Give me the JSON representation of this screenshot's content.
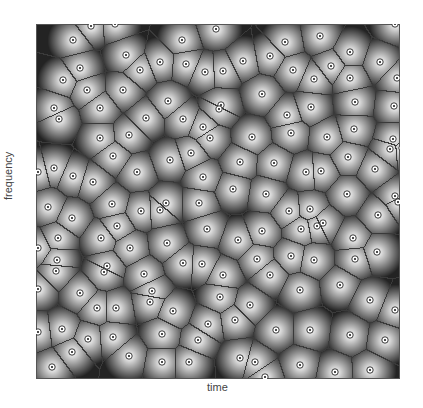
{
  "figure": {
    "xlabel": "time",
    "ylabel": "frequency",
    "plot_box": {
      "x": 36,
      "y": 24,
      "width": 364,
      "height": 355
    },
    "colors": {
      "background": "#ffffff",
      "cell_edge": "#3a3a3a",
      "shade_dark": "#111111",
      "shade_light": "#ffffff",
      "frame": "#555555"
    }
  },
  "chart_data": {
    "type": "voronoi",
    "title": "",
    "xlabel": "time",
    "ylabel": "frequency",
    "grid": false,
    "legend": null,
    "sites": [
      [
        91,
        26
      ],
      [
        115,
        24
      ],
      [
        73,
        40
      ],
      [
        126,
        55
      ],
      [
        80,
        68
      ],
      [
        140,
        70
      ],
      [
        63,
        80
      ],
      [
        87,
        90
      ],
      [
        123,
        90
      ],
      [
        100,
        108
      ],
      [
        54,
        108
      ],
      [
        59,
        119
      ],
      [
        146,
        118
      ],
      [
        100,
        138
      ],
      [
        129,
        135
      ],
      [
        182,
        40
      ],
      [
        216,
        29
      ],
      [
        160,
        62
      ],
      [
        186,
        64
      ],
      [
        205,
        72
      ],
      [
        223,
        71
      ],
      [
        243,
        61
      ],
      [
        270,
        56
      ],
      [
        262,
        94
      ],
      [
        168,
        101
      ],
      [
        221,
        105
      ],
      [
        219,
        109
      ],
      [
        183,
        119
      ],
      [
        203,
        127
      ],
      [
        210,
        138
      ],
      [
        252,
        137
      ],
      [
        395,
        24
      ],
      [
        285,
        42
      ],
      [
        320,
        36
      ],
      [
        350,
        52
      ],
      [
        380,
        62
      ],
      [
        331,
        66
      ],
      [
        293,
        70
      ],
      [
        314,
        79
      ],
      [
        350,
        78
      ],
      [
        397,
        78
      ],
      [
        355,
        102
      ],
      [
        311,
        107
      ],
      [
        394,
        106
      ],
      [
        287,
        115
      ],
      [
        354,
        129
      ],
      [
        291,
        133
      ],
      [
        327,
        137
      ],
      [
        393,
        139
      ],
      [
        402,
        148
      ],
      [
        38,
        172
      ],
      [
        54,
        168
      ],
      [
        73,
        176
      ],
      [
        93,
        182
      ],
      [
        113,
        156
      ],
      [
        137,
        172
      ],
      [
        48,
        207
      ],
      [
        72,
        218
      ],
      [
        112,
        204
      ],
      [
        141,
        211
      ],
      [
        58,
        238
      ],
      [
        101,
        238
      ],
      [
        117,
        226
      ],
      [
        130,
        248
      ],
      [
        57,
        260
      ],
      [
        107,
        266
      ],
      [
        38,
        248
      ],
      [
        170,
        160
      ],
      [
        191,
        153
      ],
      [
        240,
        162
      ],
      [
        203,
        177
      ],
      [
        233,
        189
      ],
      [
        266,
        194
      ],
      [
        166,
        203
      ],
      [
        160,
        210
      ],
      [
        199,
        203
      ],
      [
        207,
        229
      ],
      [
        262,
        231
      ],
      [
        238,
        240
      ],
      [
        301,
        229
      ],
      [
        167,
        243
      ],
      [
        183,
        263
      ],
      [
        202,
        264
      ],
      [
        257,
        259
      ],
      [
        274,
        163
      ],
      [
        306,
        172
      ],
      [
        321,
        171
      ],
      [
        348,
        157
      ],
      [
        375,
        169
      ],
      [
        390,
        149
      ],
      [
        347,
        194
      ],
      [
        395,
        196
      ],
      [
        398,
        202
      ],
      [
        289,
        211
      ],
      [
        310,
        209
      ],
      [
        378,
        215
      ],
      [
        317,
        226
      ],
      [
        323,
        223
      ],
      [
        353,
        238
      ],
      [
        291,
        256
      ],
      [
        314,
        260
      ],
      [
        355,
        259
      ],
      [
        377,
        252
      ],
      [
        56,
        271
      ],
      [
        104,
        272
      ],
      [
        144,
        274
      ],
      [
        38,
        289
      ],
      [
        80,
        293
      ],
      [
        97,
        308
      ],
      [
        116,
        308
      ],
      [
        150,
        302
      ],
      [
        38,
        332
      ],
      [
        62,
        329
      ],
      [
        88,
        339
      ],
      [
        113,
        337
      ],
      [
        72,
        352
      ],
      [
        129,
        356
      ],
      [
        52,
        367
      ],
      [
        223,
        275
      ],
      [
        270,
        275
      ],
      [
        152,
        291
      ],
      [
        220,
        297
      ],
      [
        250,
        305
      ],
      [
        173,
        311
      ],
      [
        208,
        324
      ],
      [
        235,
        320
      ],
      [
        276,
        330
      ],
      [
        162,
        334
      ],
      [
        198,
        340
      ],
      [
        240,
        358
      ],
      [
        189,
        362
      ],
      [
        162,
        362
      ],
      [
        265,
        377
      ],
      [
        255,
        362
      ],
      [
        300,
        290
      ],
      [
        340,
        285
      ],
      [
        370,
        300
      ],
      [
        395,
        310
      ],
      [
        310,
        330
      ],
      [
        350,
        335
      ],
      [
        385,
        340
      ],
      [
        300,
        365
      ],
      [
        335,
        372
      ],
      [
        370,
        370
      ]
    ]
  }
}
